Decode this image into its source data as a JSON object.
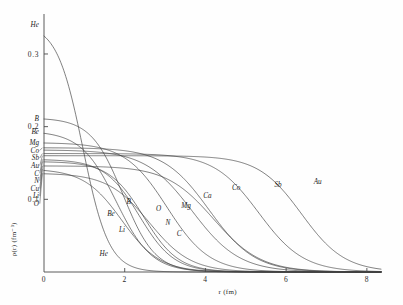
{
  "figure": {
    "background_color": "#fefefe",
    "curve_color": "#3a3a3a",
    "axis_color": "#4a4a4a"
  },
  "axes": {
    "x": {
      "label": "r (fm)",
      "ticks": [
        "0",
        "2",
        "4",
        "6",
        "8"
      ],
      "tick_values": [
        0,
        2,
        4,
        6,
        8
      ],
      "min": 0,
      "max": 8.35
    },
    "y": {
      "label": "ρ(r) (fm⁻³)",
      "label_plain": "p(r) (fm-3)",
      "ticks": [
        "0",
        "0.1",
        "0.2",
        "0.3"
      ],
      "tick_values": [
        0,
        0.1,
        0.2,
        0.3
      ],
      "min": 0,
      "max": 0.355
    }
  },
  "edge_labels": [
    {
      "text": "He",
      "value": 0.341
    },
    {
      "text": "B",
      "value": 0.212
    },
    {
      "text": "Be",
      "value": 0.194
    },
    {
      "text": "Mg",
      "value": 0.178
    },
    {
      "text": "Co",
      "value": 0.171
    },
    {
      "text": "Sb",
      "value": 0.163
    },
    {
      "text": "Au",
      "value": 0.16
    },
    {
      "text": "C",
      "value": 0.155
    },
    {
      "text": "N",
      "value": 0.152
    },
    {
      "text": "Cu",
      "value": 0.146
    },
    {
      "text": "Li",
      "value": 0.142
    },
    {
      "text": "O",
      "value": 0.136
    }
  ],
  "curve_labels": [
    {
      "text": "He"
    },
    {
      "text": "Li"
    },
    {
      "text": "Be"
    },
    {
      "text": "B"
    },
    {
      "text": "C"
    },
    {
      "text": "N"
    },
    {
      "text": "O"
    },
    {
      "text": "Mg"
    },
    {
      "text": "Ca"
    },
    {
      "text": "Co"
    },
    {
      "text": "Sb"
    },
    {
      "text": "Au"
    }
  ],
  "chart_data": {
    "type": "line",
    "xlabel": "r (fm)",
    "ylabel": "ρ(r) (fm⁻³)",
    "xlim": [
      0,
      8.35
    ],
    "ylim": [
      0,
      0.355
    ],
    "grid": false,
    "legend": "inline-curve-labels",
    "note": "Two-parameter Fermi charge densities rho(r)=rho0/(1+exp((r-c)/a)) for nuclei He through Au; rho0 = central density, c = half-density radius (fm), a = surface diffuseness (fm).",
    "series": [
      {
        "name": "He",
        "rho0": 0.341,
        "c": 0.964,
        "a": 0.322,
        "edge_label": "He",
        "curve_label": "He",
        "curve_label_xy": [
          1.48,
          0.0215
        ]
      },
      {
        "name": "Li",
        "rho0": 0.142,
        "c": 1.93,
        "a": 0.47,
        "edge_label": "Li",
        "curve_label": "Li",
        "curve_label_xy": [
          1.93,
          0.0545
        ]
      },
      {
        "name": "Be",
        "rho0": 0.194,
        "c": 1.79,
        "a": 0.437,
        "edge_label": "Be",
        "curve_label": "Be",
        "curve_label_xy": [
          1.66,
          0.0775
        ]
      },
      {
        "name": "B",
        "rho0": 0.212,
        "c": 1.96,
        "a": 0.396,
        "edge_label": "B",
        "curve_label": "B",
        "curve_label_xy": [
          2.1,
          0.093
        ]
      },
      {
        "name": "C",
        "rho0": 0.155,
        "c": 2.36,
        "a": 0.43,
        "edge_label": "C",
        "curve_label": "C",
        "curve_label_xy": [
          3.35,
          0.05
        ]
      },
      {
        "name": "N",
        "rho0": 0.152,
        "c": 2.47,
        "a": 0.428,
        "edge_label": "N",
        "curve_label": "N",
        "curve_label_xy": [
          3.07,
          0.0645
        ]
      },
      {
        "name": "O",
        "rho0": 0.136,
        "c": 2.61,
        "a": 0.513,
        "edge_label": "O",
        "curve_label": "O",
        "curve_label_xy": [
          2.84,
          0.0835
        ]
      },
      {
        "name": "Mg",
        "rho0": 0.178,
        "c": 3.05,
        "a": 0.523,
        "edge_label": "Mg",
        "curve_label": "Mg",
        "curve_label_xy": [
          3.52,
          0.088
        ]
      },
      {
        "name": "Ca",
        "rho0": 0.168,
        "c": 3.67,
        "a": 0.585,
        "edge_label": "",
        "curve_label": "Ca",
        "curve_label_xy": [
          4.05,
          0.102
        ]
      },
      {
        "name": "Co",
        "rho0": 0.171,
        "c": 4.09,
        "a": 0.565,
        "edge_label": "Co",
        "curve_label": "Co",
        "curve_label_xy": [
          4.76,
          0.1135
        ]
      },
      {
        "name": "Sb",
        "rho0": 0.163,
        "c": 5.32,
        "a": 0.554,
        "edge_label": "Sb",
        "curve_label": "Sb",
        "curve_label_xy": [
          5.8,
          0.117
        ]
      },
      {
        "name": "Cu",
        "rho0": 0.146,
        "c": 4.2,
        "a": 0.586,
        "edge_label": "Cu",
        "curve_label": "",
        "curve_label_xy": null
      },
      {
        "name": "Au",
        "rho0": 0.16,
        "c": 6.38,
        "a": 0.535,
        "edge_label": "Au",
        "curve_label": "Au",
        "curve_label_xy": [
          6.78,
          0.1205
        ]
      }
    ]
  }
}
